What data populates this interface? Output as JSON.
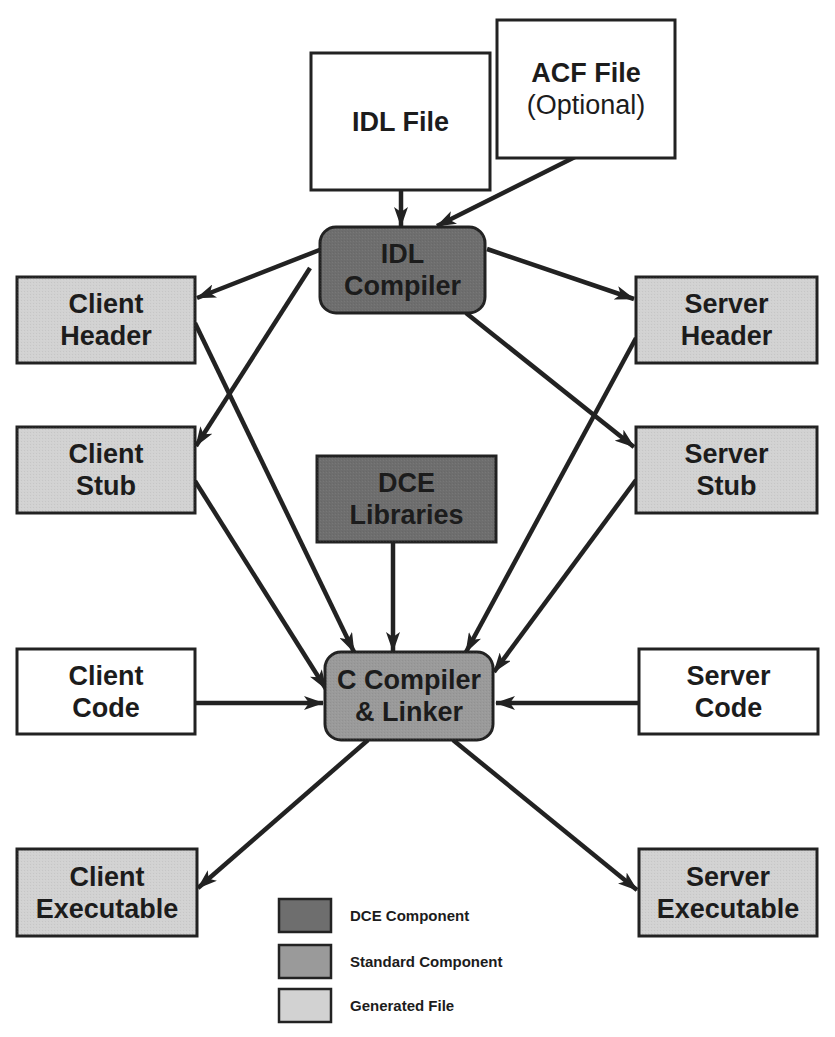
{
  "colors": {
    "dce_component": "#6e6e6e",
    "standard_component": "#9a9a9a",
    "generated_file": "#d2d2d2",
    "input_file": "#ffffff",
    "stroke": "#222222"
  },
  "nodes": [
    {
      "id": "idl-file",
      "lines": [
        "IDL File"
      ],
      "kind": "input_file"
    },
    {
      "id": "acf-file",
      "lines": [
        "ACF File",
        "(Optional)"
      ],
      "kind": "input_file"
    },
    {
      "id": "idl-compiler",
      "lines": [
        "IDL",
        "Compiler"
      ],
      "kind": "dce_component"
    },
    {
      "id": "client-header",
      "lines": [
        "Client",
        "Header"
      ],
      "kind": "generated_file"
    },
    {
      "id": "client-stub",
      "lines": [
        "Client",
        "Stub"
      ],
      "kind": "generated_file"
    },
    {
      "id": "server-header",
      "lines": [
        "Server",
        "Header"
      ],
      "kind": "generated_file"
    },
    {
      "id": "server-stub",
      "lines": [
        "Server",
        "Stub"
      ],
      "kind": "generated_file"
    },
    {
      "id": "dce-libraries",
      "lines": [
        "DCE",
        "Libraries"
      ],
      "kind": "dce_component"
    },
    {
      "id": "c-compiler",
      "lines": [
        "C Compiler",
        "& Linker"
      ],
      "kind": "standard_component"
    },
    {
      "id": "client-code",
      "lines": [
        "Client",
        "Code"
      ],
      "kind": "input_file"
    },
    {
      "id": "server-code",
      "lines": [
        "Server",
        "Code"
      ],
      "kind": "input_file"
    },
    {
      "id": "client-executable",
      "lines": [
        "Client",
        "Executable"
      ],
      "kind": "generated_file"
    },
    {
      "id": "server-executable",
      "lines": [
        "Server",
        "Executable"
      ],
      "kind": "generated_file"
    }
  ],
  "edges": [
    {
      "from": "idl-file",
      "to": "idl-compiler"
    },
    {
      "from": "acf-file",
      "to": "idl-compiler"
    },
    {
      "from": "idl-compiler",
      "to": "client-header"
    },
    {
      "from": "idl-compiler",
      "to": "client-stub"
    },
    {
      "from": "idl-compiler",
      "to": "server-header"
    },
    {
      "from": "idl-compiler",
      "to": "server-stub"
    },
    {
      "from": "client-header",
      "to": "c-compiler"
    },
    {
      "from": "client-stub",
      "to": "c-compiler"
    },
    {
      "from": "server-header",
      "to": "c-compiler"
    },
    {
      "from": "server-stub",
      "to": "c-compiler"
    },
    {
      "from": "dce-libraries",
      "to": "c-compiler"
    },
    {
      "from": "client-code",
      "to": "c-compiler"
    },
    {
      "from": "server-code",
      "to": "c-compiler"
    },
    {
      "from": "c-compiler",
      "to": "client-executable"
    },
    {
      "from": "c-compiler",
      "to": "server-executable"
    }
  ],
  "legend": [
    {
      "label": "DCE Component",
      "kind": "dce_component"
    },
    {
      "label": "Standard Component",
      "kind": "standard_component"
    },
    {
      "label": "Generated File",
      "kind": "generated_file"
    }
  ]
}
